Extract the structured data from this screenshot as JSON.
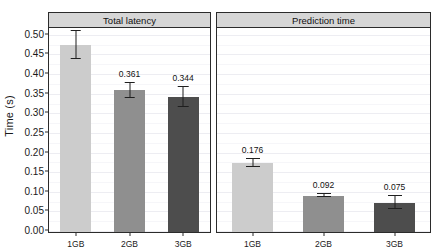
{
  "chart_data": {
    "type": "bar",
    "title": "",
    "xlabel": "",
    "ylabel": "Time (s)",
    "ylim": [
      0.0,
      0.52
    ],
    "grid": true,
    "legend": false,
    "categories": [
      "1GB",
      "2GB",
      "3GB"
    ],
    "ytick_labels": [
      "0.00",
      "0.05",
      "0.10",
      "0.15",
      "0.20",
      "0.25",
      "0.30",
      "0.35",
      "0.40",
      "0.45",
      "0.50"
    ],
    "ytick_values": [
      0.0,
      0.05,
      0.1,
      0.15,
      0.2,
      0.25,
      0.3,
      0.35,
      0.4,
      0.45,
      0.5
    ],
    "panels": [
      {
        "title": "Total latency",
        "values": [
          0.476,
          0.361,
          0.344
        ],
        "value_labels": [
          "0.476",
          "0.361",
          "0.344"
        ],
        "errors": [
          0.036,
          0.02,
          0.026
        ],
        "colors": [
          "#cccccc",
          "#8f8f8f",
          "#4d4d4d"
        ]
      },
      {
        "title": "Prediction time",
        "values": [
          0.176,
          0.092,
          0.075
        ],
        "value_labels": [
          "0.176",
          "0.092",
          "0.075"
        ],
        "errors": [
          0.009,
          0.004,
          0.016
        ],
        "colors": [
          "#cccccc",
          "#8f8f8f",
          "#4d4d4d"
        ]
      }
    ]
  }
}
